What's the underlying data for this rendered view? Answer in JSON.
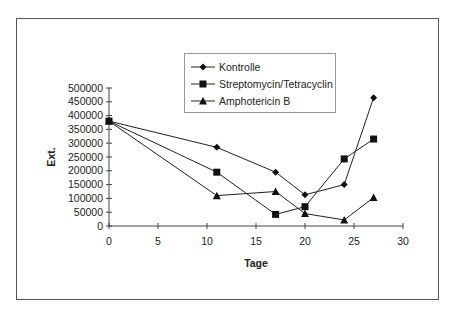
{
  "chart_data": {
    "type": "line",
    "title": "",
    "xlabel": "Tage",
    "ylabel": "Ext.",
    "xlim": [
      0,
      30
    ],
    "ylim": [
      0,
      500000
    ],
    "x_ticks": [
      0,
      5,
      10,
      15,
      20,
      25,
      30
    ],
    "y_ticks": [
      0,
      50000,
      100000,
      150000,
      200000,
      250000,
      300000,
      350000,
      400000,
      450000,
      500000
    ],
    "grid": false,
    "legend_position": "top-center inside",
    "series": [
      {
        "name": "Kontrolle",
        "marker": "diamond",
        "x": [
          0,
          11,
          17,
          20,
          24,
          27
        ],
        "values": [
          380000,
          285000,
          195000,
          113000,
          150000,
          465000
        ]
      },
      {
        "name": "Streptomycin/Tetracyclin",
        "marker": "square",
        "x": [
          0,
          11,
          17,
          20,
          24,
          27
        ],
        "values": [
          380000,
          195000,
          42000,
          70000,
          243000,
          315000
        ]
      },
      {
        "name": "Amphotericin B",
        "marker": "triangle",
        "x": [
          0,
          11,
          17,
          20,
          24,
          27
        ],
        "values": [
          380000,
          110000,
          125000,
          45000,
          22000,
          103000
        ]
      }
    ]
  },
  "legend": {
    "items": [
      "Kontrolle",
      "Streptomycin/Tetracyclin",
      "Amphotericin B"
    ]
  }
}
